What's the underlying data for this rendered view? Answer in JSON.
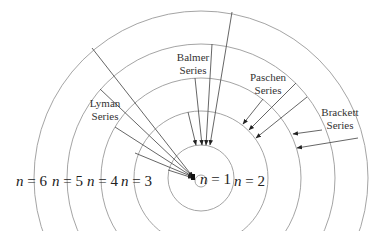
{
  "diagram": {
    "center": {
      "x": 201,
      "y": 178
    },
    "colors": {
      "orbit": "#9a9a9a",
      "transition": "#555555",
      "text": "#333333"
    },
    "orbits": [
      {
        "n": 1,
        "r": 6
      },
      {
        "n": 2,
        "r": 33
      },
      {
        "n": 3,
        "r": 67
      },
      {
        "n": 4,
        "r": 100
      },
      {
        "n": 5,
        "r": 134
      },
      {
        "n": 6,
        "r": 167
      }
    ],
    "level_labels": [
      {
        "id": "n6",
        "var": "n",
        "eq": " = 6",
        "x": 16,
        "y": 186
      },
      {
        "id": "n5",
        "var": "n",
        "eq": " = 5",
        "x": 52,
        "y": 186
      },
      {
        "id": "n4",
        "var": "n",
        "eq": " = 4",
        "x": 87,
        "y": 186
      },
      {
        "id": "n3",
        "var": "n",
        "eq": " = 3",
        "x": 121,
        "y": 186
      },
      {
        "id": "n1",
        "var": "n",
        "eq": " = 1",
        "x": 200,
        "y": 184
      },
      {
        "id": "n2",
        "var": "n",
        "eq": " = 2",
        "x": 234,
        "y": 186
      }
    ],
    "series": [
      {
        "name": "Lyman",
        "label_line1": "Lyman",
        "label_line2": "Series",
        "label_x": 105,
        "label_y1": 107,
        "label_y2": 120,
        "final_n": 1,
        "transitions": [
          {
            "from_n": 6,
            "x1": 92,
            "y1": 48,
            "x2": 193,
            "y2": 177
          },
          {
            "from_n": 5,
            "x1": 100,
            "y1": 89,
            "x2": 193,
            "y2": 177
          },
          {
            "from_n": 4,
            "x1": 115,
            "y1": 127,
            "x2": 193,
            "y2": 177
          },
          {
            "from_n": 3,
            "x1": 135,
            "y1": 153,
            "x2": 193,
            "y2": 177
          },
          {
            "from_n": 2,
            "x1": 168,
            "y1": 170,
            "x2": 193,
            "y2": 178
          }
        ]
      },
      {
        "name": "Balmer",
        "label_line1": "Balmer",
        "label_line2": "Series",
        "label_x": 193,
        "label_y1": 61,
        "label_y2": 74,
        "final_n": 2,
        "transitions": [
          {
            "from_n": 6,
            "x1": 232,
            "y1": 12,
            "x2": 210,
            "y2": 145
          },
          {
            "from_n": 5,
            "x1": 212,
            "y1": 44,
            "x2": 206,
            "y2": 145
          },
          {
            "from_n": 4,
            "x1": 195,
            "y1": 78,
            "x2": 202,
            "y2": 145
          },
          {
            "from_n": 3,
            "x1": 188,
            "y1": 112,
            "x2": 196,
            "y2": 145
          }
        ]
      },
      {
        "name": "Paschen",
        "label_line1": "Paschen",
        "label_line2": "Series",
        "label_x": 268,
        "label_y1": 81,
        "label_y2": 94,
        "final_n": 3,
        "transitions": [
          {
            "from_n": 6,
            "x1": 263,
            "y1": 99,
            "x2": 243,
            "y2": 124
          },
          {
            "from_n": 5,
            "x1": 296,
            "y1": 83,
            "x2": 249,
            "y2": 130
          },
          {
            "from_n": 4,
            "x1": 307,
            "y1": 97,
            "x2": 256,
            "y2": 138
          }
        ]
      },
      {
        "name": "Brackett",
        "label_line1": "Brackett",
        "label_line2": "Series",
        "label_x": 340,
        "label_y1": 116,
        "label_y2": 129,
        "final_n": 4,
        "transitions": [
          {
            "from_n": 5,
            "x1": 322,
            "y1": 130,
            "x2": 293,
            "y2": 134
          },
          {
            "from_n": 6,
            "x1": 358,
            "y1": 138,
            "x2": 297,
            "y2": 148
          }
        ]
      }
    ]
  }
}
